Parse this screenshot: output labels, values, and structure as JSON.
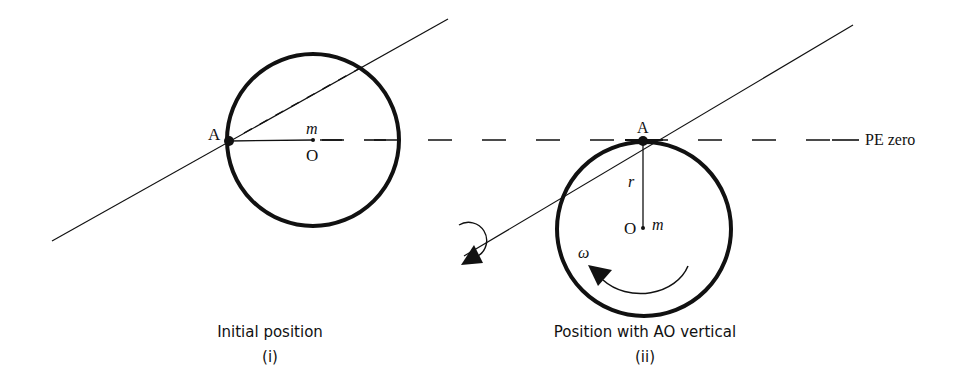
{
  "figure": {
    "panel_i": {
      "caption": "Initial position",
      "label": "(i)",
      "point_A": "A",
      "center_O": "O",
      "mass": "m"
    },
    "panel_ii": {
      "caption": "Position with AO vertical",
      "label": "(ii)",
      "point_A": "A",
      "center_O": "O",
      "mass": "m",
      "radius": "r",
      "angular_velocity": "ω"
    },
    "reference_line": "PE zero",
    "colors": {
      "ink": "#111111",
      "background": "#ffffff"
    }
  }
}
